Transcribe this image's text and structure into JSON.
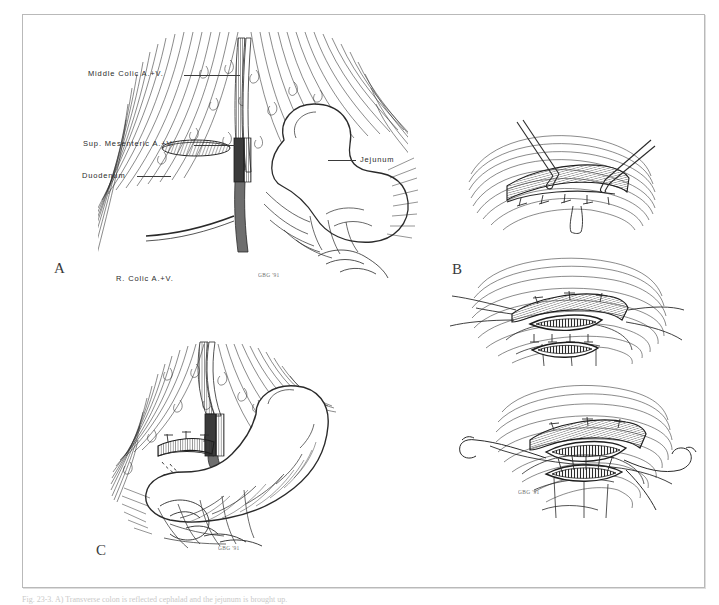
{
  "figure": {
    "caption": "Fig. 23-3. A) Transverse colon is reflected cephalad and the jejunum is brought up.",
    "artist_signature": "GBG '91",
    "border_color": "#b9b9b9",
    "ink_color": "#2a2a2a",
    "background": "#ffffff"
  },
  "panels": [
    {
      "id": "A",
      "letter": "A",
      "title": "Mobilization of the jejunal loop beneath the transverse mesocolon",
      "labels": [
        {
          "name": "middle-colic-vessels",
          "text": "Middle Colic A.+V."
        },
        {
          "name": "superior-mesenteric-vessels",
          "text": "Sup. Mesenteric A.+V."
        },
        {
          "name": "duodenum",
          "text": "Duodenum"
        },
        {
          "name": "jejunum",
          "text": "Jejunum"
        },
        {
          "name": "right-colic-vessels",
          "text": "R. Colic A.+V."
        }
      ]
    },
    {
      "id": "B",
      "letter": "B",
      "title": "Creation of the side-to-side anastomosis with stay sutures and enterotomies",
      "labels": []
    },
    {
      "id": "C",
      "letter": "C",
      "title": "Completed gastrojejunal anastomosis",
      "labels": []
    }
  ]
}
